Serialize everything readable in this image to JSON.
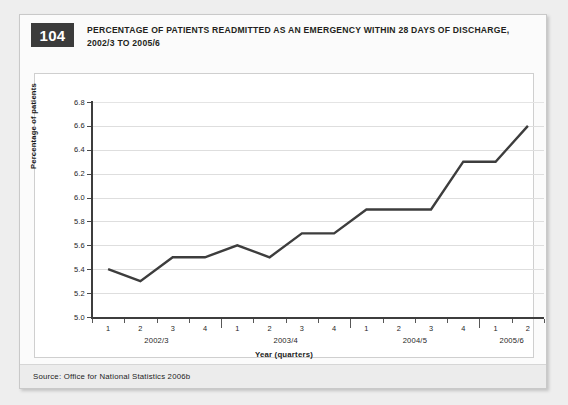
{
  "figure": {
    "number": "104",
    "title_line1": "PERCENTAGE OF PATIENTS READMITTED AS AN EMERGENCY WITHIN 28 DAYS OF DISCHARGE,",
    "title_line2": "2002/3 TO 2005/6",
    "source": "Source: Office for National Statistics 2006b",
    "badge_color": "#3b3b3b",
    "line_color": "#3d3d3d",
    "grid_color": "#dedede",
    "card_background": "#fbfbfb",
    "page_background": "#eeeeee"
  },
  "chart_data": {
    "type": "line",
    "title": "Percentage of patients readmitted as an emergency within 28 days of discharge, 2002/3 to 2005/6",
    "xlabel": "Year (quarters)",
    "ylabel": "Percentage of patients",
    "ylim": [
      5.0,
      6.8
    ],
    "ytick_step": 0.2,
    "yticks": [
      "6.8",
      "6.6",
      "6.4",
      "6.2",
      "6.0",
      "5.8",
      "5.6",
      "5.4",
      "5.2",
      "5.0"
    ],
    "ytick_values": [
      6.8,
      6.6,
      6.4,
      6.2,
      6.0,
      5.8,
      5.6,
      5.4,
      5.2,
      5.0
    ],
    "grid": true,
    "grid_axis": "y",
    "legend": false,
    "categories": [
      "2002/3 Q1",
      "2002/3 Q2",
      "2002/3 Q3",
      "2002/3 Q4",
      "2003/4 Q1",
      "2003/4 Q2",
      "2003/4 Q3",
      "2003/4 Q4",
      "2004/5 Q1",
      "2004/5 Q2",
      "2004/5 Q3",
      "2004/5 Q4",
      "2005/6 Q1",
      "2005/6 Q2"
    ],
    "quarter_labels": [
      "1",
      "2",
      "3",
      "4",
      "1",
      "2",
      "3",
      "4",
      "1",
      "2",
      "3",
      "4",
      "1",
      "2"
    ],
    "year_groups": [
      {
        "label": "2002/3",
        "quarters": 4
      },
      {
        "label": "2003/4",
        "quarters": 4
      },
      {
        "label": "2004/5",
        "quarters": 4
      },
      {
        "label": "2005/6",
        "quarters": 2
      }
    ],
    "values": [
      5.4,
      5.3,
      5.5,
      5.5,
      5.6,
      5.5,
      5.7,
      5.7,
      5.9,
      5.9,
      5.9,
      6.3,
      6.3,
      6.6
    ],
    "series": [
      {
        "name": "Percentage of patients readmitted",
        "values": [
          5.4,
          5.3,
          5.5,
          5.5,
          5.6,
          5.5,
          5.7,
          5.7,
          5.9,
          5.9,
          5.9,
          6.3,
          6.3,
          6.6
        ]
      }
    ]
  }
}
